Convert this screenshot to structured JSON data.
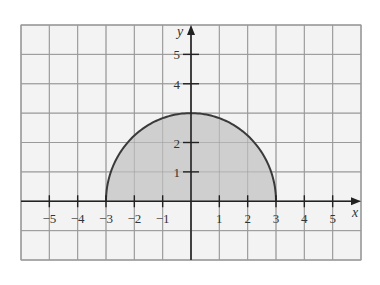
{
  "chart_data": {
    "type": "area",
    "title": "",
    "function": "y = sqrt(9 - x^2)",
    "domain": [
      -3,
      3
    ],
    "x": [
      -3,
      -2.5,
      -2,
      -1.5,
      -1,
      -0.5,
      0,
      0.5,
      1,
      1.5,
      2,
      2.5,
      3
    ],
    "series": [
      {
        "name": "semicircle",
        "values": [
          0,
          1.66,
          2.24,
          2.6,
          2.83,
          2.96,
          3,
          2.96,
          2.83,
          2.6,
          2.24,
          1.66,
          0
        ]
      }
    ],
    "xlabel": "x",
    "ylabel": "y",
    "xlim": [
      -6,
      6
    ],
    "ylim": [
      -2,
      6
    ],
    "x_tick_labels": [
      "-5",
      "-4",
      "-3",
      "-2",
      "-1",
      "1",
      "2",
      "3",
      "4",
      "5"
    ],
    "y_tick_labels": [
      "1",
      "2",
      "4",
      "5"
    ],
    "grid": true,
    "legend": "none",
    "colors": {
      "fill": "#cfcfcf",
      "curve": "#3a3a3a",
      "grid": "#9a9a9a",
      "background": "#f3f3f3",
      "axis": "#222222"
    }
  }
}
